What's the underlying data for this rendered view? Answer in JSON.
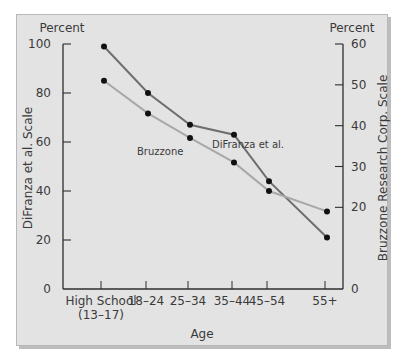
{
  "chart_data": {
    "type": "line",
    "title": "",
    "xlabel": "Age",
    "ylabel_left": "DiFranza et al. Scale",
    "ylabel_right": "Bruzzone Research Corp. Scale",
    "unit_left": "Percent",
    "unit_right": "Percent",
    "categories": [
      "High School (13–17)",
      "18–24",
      "25–34",
      "35–44",
      "45–54",
      "55+"
    ],
    "category_lines": [
      [
        "High School",
        "(13–17)"
      ],
      [
        "18–24"
      ],
      [
        "25–34"
      ],
      [
        "35–44"
      ],
      [
        "45–54"
      ],
      [
        "55+"
      ]
    ],
    "left_axis": {
      "range": [
        0,
        100
      ],
      "ticks": [
        0,
        20,
        40,
        60,
        80,
        100
      ]
    },
    "right_axis": {
      "range": [
        0,
        60
      ],
      "ticks": [
        0,
        20,
        30,
        40,
        50,
        60
      ]
    },
    "series": [
      {
        "name": "DiFranza et al.",
        "axis": "left",
        "color": "#6e6e6e",
        "values": [
          99,
          80,
          67,
          63,
          44,
          21
        ]
      },
      {
        "name": "Bruzzone",
        "axis": "right",
        "color": "#a8a8a8",
        "values": [
          51,
          43,
          37,
          31,
          24,
          19
        ]
      }
    ],
    "annotations": [
      {
        "text": "DiFranza et al.",
        "series": "DiFranza et al."
      },
      {
        "text": "Bruzzone",
        "series": "Bruzzone"
      }
    ],
    "grid": false,
    "legend": "inline labels"
  }
}
